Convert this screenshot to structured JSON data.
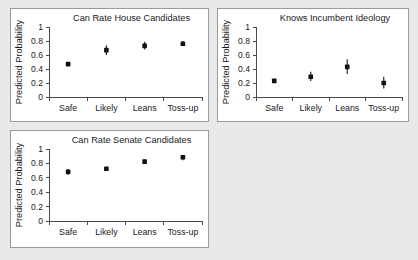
{
  "page": {
    "background_color": "#e9e9e9",
    "panel_background_color": "#ffffff",
    "panel_border_color": "#9a9a9a",
    "marker_color": "#111111",
    "axis_color": "#4a4a4a"
  },
  "shared": {
    "ylabel": "Predicted Probability",
    "categories": [
      "Safe",
      "Likely",
      "Leans",
      "Toss-up"
    ],
    "ytick_labels": [
      "0",
      "0.2",
      "0.4",
      "0.6",
      "0.8",
      "1"
    ],
    "ytick_values": [
      0,
      0.2,
      0.4,
      0.6,
      0.8,
      1
    ],
    "ylim": [
      0,
      1
    ]
  },
  "chart_data": [
    {
      "id": "house",
      "type": "scatter",
      "title": "Can Rate House Candidates",
      "xlabel": "",
      "ylabel": "Predicted Probability",
      "categories": [
        "Safe",
        "Likely",
        "Leans",
        "Toss-up"
      ],
      "values": [
        0.47,
        0.67,
        0.73,
        0.76
      ],
      "error_low": [
        0.45,
        0.6,
        0.68,
        0.73
      ],
      "error_high": [
        0.49,
        0.74,
        0.79,
        0.8
      ],
      "ylim": [
        0,
        1
      ],
      "yticks": [
        0,
        0.2,
        0.4,
        0.6,
        0.8,
        1
      ],
      "grid": false,
      "legend": "none"
    },
    {
      "id": "ideology",
      "type": "scatter",
      "title": "Knows Incumbent Ideology",
      "xlabel": "",
      "ylabel": "Predicted Probability",
      "categories": [
        "Safe",
        "Likely",
        "Leans",
        "Toss-up"
      ],
      "values": [
        0.23,
        0.29,
        0.43,
        0.2
      ],
      "error_low": [
        0.2,
        0.23,
        0.33,
        0.12
      ],
      "error_high": [
        0.26,
        0.36,
        0.54,
        0.29
      ],
      "ylim": [
        0,
        1
      ],
      "yticks": [
        0,
        0.2,
        0.4,
        0.6,
        0.8,
        1
      ],
      "grid": false,
      "legend": "none"
    },
    {
      "id": "senate",
      "type": "scatter",
      "title": "Can Rate Senate Candidates",
      "xlabel": "",
      "ylabel": "Predicted Probability",
      "categories": [
        "Safe",
        "Likely",
        "Leans",
        "Toss-up"
      ],
      "values": [
        0.685,
        0.725,
        0.825,
        0.885
      ],
      "error_low": [
        0.64,
        0.705,
        0.79,
        0.845
      ],
      "error_high": [
        0.72,
        0.745,
        0.855,
        0.915
      ],
      "ylim": [
        0,
        1
      ],
      "yticks": [
        0,
        0.2,
        0.4,
        0.6,
        0.8,
        1
      ],
      "grid": false,
      "legend": "none"
    }
  ]
}
